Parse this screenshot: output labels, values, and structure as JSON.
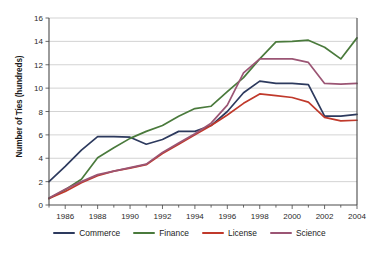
{
  "chart_data": {
    "type": "line",
    "title": "",
    "xlabel": "",
    "ylabel": "Number of Ties (hundreds)",
    "xlim": [
      1985,
      2004
    ],
    "ylim": [
      0,
      16
    ],
    "ytick_step": 2,
    "yticks": [
      0,
      2,
      4,
      6,
      8,
      10,
      12,
      14,
      16
    ],
    "xticks": [
      1986,
      1988,
      1990,
      1992,
      1994,
      1996,
      1998,
      2000,
      2002,
      2004
    ],
    "x": [
      1985,
      1986,
      1987,
      1988,
      1989,
      1990,
      1991,
      1992,
      1993,
      1994,
      1995,
      1996,
      1997,
      1998,
      1999,
      2000,
      2001,
      2002,
      2003,
      2004
    ],
    "grid": "horizontal",
    "legend_position": "bottom",
    "series": [
      {
        "name": "Commerce",
        "color": "#2d3a5e",
        "values": [
          2.0,
          3.3,
          4.7,
          5.85,
          5.85,
          5.8,
          5.2,
          5.6,
          6.3,
          6.3,
          6.8,
          8.0,
          9.6,
          10.6,
          10.4,
          10.4,
          10.3,
          7.6,
          7.6,
          7.75
        ]
      },
      {
        "name": "Finance",
        "color": "#4a7a3c",
        "values": [
          0.55,
          1.3,
          2.2,
          4.05,
          4.9,
          5.7,
          6.3,
          6.8,
          7.6,
          8.25,
          8.45,
          9.7,
          10.9,
          12.5,
          13.95,
          14.0,
          14.1,
          13.5,
          12.5,
          14.3
        ]
      },
      {
        "name": "License",
        "color": "#c0392b",
        "values": [
          0.55,
          1.15,
          1.9,
          2.5,
          2.9,
          3.15,
          3.45,
          4.4,
          5.2,
          6.0,
          6.8,
          7.7,
          8.7,
          9.5,
          9.35,
          9.2,
          8.8,
          7.5,
          7.2,
          7.25
        ]
      },
      {
        "name": "Science",
        "color": "#9b5574",
        "values": [
          0.6,
          1.35,
          2.0,
          2.6,
          2.9,
          3.2,
          3.5,
          4.5,
          5.3,
          6.1,
          7.0,
          8.55,
          11.3,
          12.5,
          12.5,
          12.5,
          12.2,
          10.4,
          10.35,
          10.4
        ]
      }
    ]
  },
  "axes": {
    "ylabel": "Number of Ties (hundreds)",
    "y_tick_labels": [
      "0",
      "2",
      "4",
      "6",
      "8",
      "10",
      "12",
      "14",
      "16"
    ],
    "x_tick_labels": [
      "1986",
      "1988",
      "1990",
      "1992",
      "1994",
      "1996",
      "1998",
      "2000",
      "2002",
      "2004"
    ]
  },
  "legend": {
    "items": [
      {
        "label": "Commerce",
        "color": "#2d3a5e"
      },
      {
        "label": "Finance",
        "color": "#4a7a3c"
      },
      {
        "label": "License",
        "color": "#c0392b"
      },
      {
        "label": "Science",
        "color": "#9b5574"
      }
    ]
  },
  "style": {
    "grid_color": "#c8c8c8",
    "axis_color": "#5a5a5a",
    "background": "#ffffff",
    "text_color": "#1a1a1a"
  }
}
